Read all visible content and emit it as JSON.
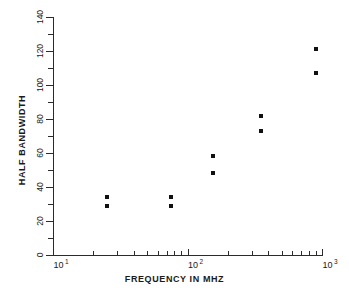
{
  "chart_data": {
    "type": "scatter",
    "title": "",
    "xlabel": "FREQUENCY  IN  MHZ",
    "ylabel": "HALF  BANDWIDTH",
    "xscale": "log",
    "yscale": "linear",
    "xlim": [
      10,
      1000
    ],
    "ylim": [
      0,
      140
    ],
    "grid": false,
    "legend": null,
    "x_tick_labels": [
      "10",
      "10",
      "10"
    ],
    "x_tick_exponents": [
      "1",
      "2",
      "3"
    ],
    "x_tick_values": [
      10,
      100,
      1000
    ],
    "y_tick_labels": [
      "0",
      "20",
      "40",
      "60",
      "80",
      "100",
      "120",
      "140"
    ],
    "y_tick_values": [
      0,
      20,
      40,
      60,
      80,
      100,
      120,
      140
    ],
    "marker": "square",
    "marker_color": "#111111",
    "axis_color": "#2b2b2b",
    "background_color": "#ffffff",
    "points": [
      {
        "x": 25,
        "y": 34
      },
      {
        "x": 25,
        "y": 29
      },
      {
        "x": 76,
        "y": 34
      },
      {
        "x": 76,
        "y": 29
      },
      {
        "x": 155,
        "y": 58
      },
      {
        "x": 155,
        "y": 48
      },
      {
        "x": 350,
        "y": 82
      },
      {
        "x": 350,
        "y": 73
      },
      {
        "x": 900,
        "y": 121
      },
      {
        "x": 900,
        "y": 107
      }
    ]
  }
}
